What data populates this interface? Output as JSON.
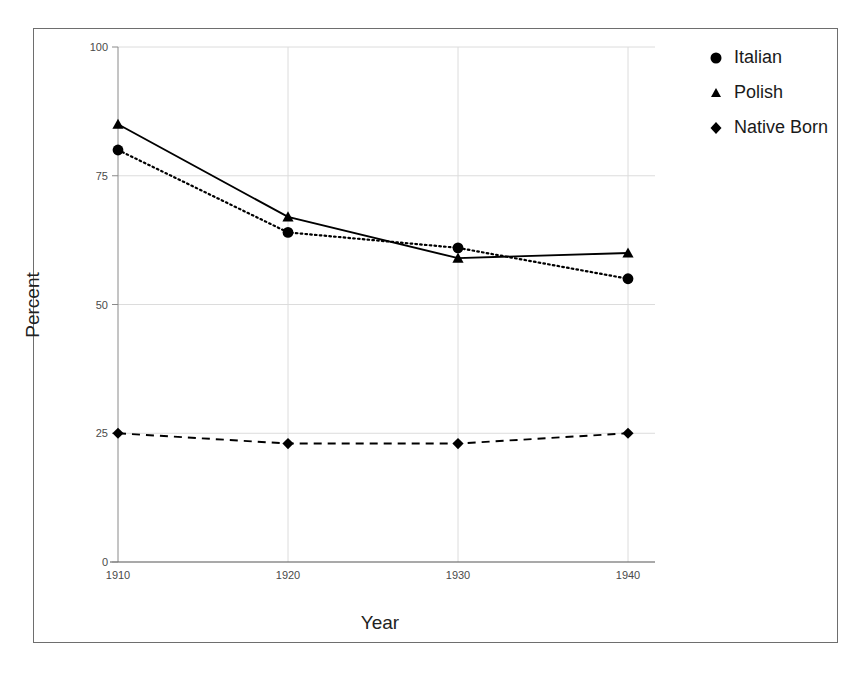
{
  "chart_data": {
    "type": "line",
    "title": "",
    "xlabel": "Year",
    "ylabel": "Percent",
    "x": [
      1910,
      1920,
      1930,
      1940
    ],
    "categories": [
      "1910",
      "1920",
      "1930",
      "1940"
    ],
    "xlim": [
      1910,
      1940
    ],
    "ylim": [
      0,
      100
    ],
    "ytick_labels": [
      "100",
      "75",
      "50",
      "25",
      "0"
    ],
    "ytick_values": [
      100,
      75,
      50,
      25,
      0
    ],
    "xtick_labels": [
      "1910",
      "1920",
      "1930",
      "1940"
    ],
    "grid": true,
    "legend_position": "right-outside",
    "series": [
      {
        "name": "Italian",
        "marker": "circle",
        "linestyle": "dotted",
        "color": "#000000",
        "values": [
          80,
          64,
          61,
          55
        ]
      },
      {
        "name": "Polish",
        "marker": "triangle",
        "linestyle": "solid",
        "color": "#000000",
        "values": [
          85,
          67,
          59,
          60
        ]
      },
      {
        "name": "Native Born",
        "marker": "diamond",
        "linestyle": "dashed",
        "color": "#000000",
        "values": [
          25,
          23,
          23,
          25
        ]
      }
    ]
  },
  "axes": {
    "x_axis_title": "Year",
    "y_axis_title": "Percent"
  },
  "legend": {
    "entries": [
      {
        "label": "Italian",
        "marker": "circle-marker"
      },
      {
        "label": "Polish",
        "marker": "triangle-marker"
      },
      {
        "label": "Native Born",
        "marker": "diamond-marker"
      }
    ]
  },
  "colors": {
    "foreground": "#000000",
    "frame": "#6e6e6e",
    "axis": "#8a8a8a",
    "grid": "#dcdcdc",
    "tick_text": "#4a4a4a"
  }
}
